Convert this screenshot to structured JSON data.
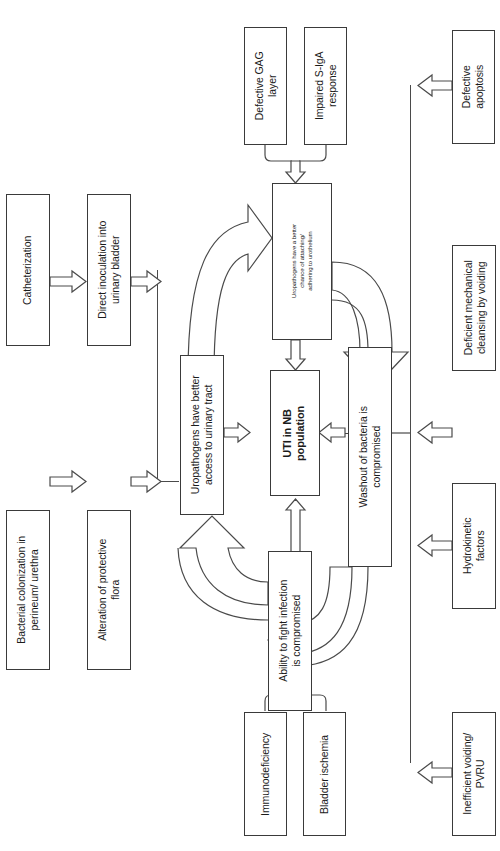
{
  "diagram": {
    "orientation": "rotated-90-ccw",
    "nodes": {
      "catheterization": "Catheterization",
      "direct_inoculation": "Direct inoculation into urinary bladder",
      "bacterial_colonization": "Bacterial colonization in perineum/ urethra",
      "alteration_flora": "Alteration of protective flora",
      "defective_gag": "Defective GAG layer",
      "impaired_siga": "Impaired S-IgA response",
      "uropathogens_adhere": "Uropathogens have a better chance of attaching/ adhering to urothelium",
      "uropathogens_access": "Uropathogens have better access to urinary tract",
      "uti_nb": "UTI in NB population",
      "washout": "Washout of bacteria is compromised",
      "ability_fight": "Ability to fight infection is compromised",
      "immunodeficiency": "Immunodeficiency",
      "bladder_ischemia": "Bladder ischemia",
      "defective_apoptosis": "Defective apoptosis",
      "deficient_cleansing": "Deficient mechanical cleansing by voiding",
      "hydrokinetic": "Hydrokinetic factors",
      "inefficient_voiding": "Inefficient voiding/ PVRU"
    },
    "node_lines": {
      "catheterization": [
        "Catheterization"
      ],
      "direct_inoculation": [
        "Direct inoculation into",
        "urinary bladder"
      ],
      "bacterial_colonization": [
        "Bacterial colonization in",
        "perineum/ urethra"
      ],
      "alteration_flora": [
        "Alteration of protective",
        "flora"
      ],
      "defective_gag": [
        "Defective GAG",
        "layer"
      ],
      "impaired_siga": [
        "Impaired S-IgA",
        "response"
      ],
      "uropathogens_adhere": [
        "Uropathogens have a better",
        "chance of attaching/",
        "adhering to urothelium"
      ],
      "uropathogens_access": [
        "Uropathogens have better",
        "access to urinary tract"
      ],
      "uti_nb": [
        "UTI in NB",
        "population"
      ],
      "washout": [
        "Washout of bacteria is",
        "compromised"
      ],
      "ability_fight": [
        "Ability to fight infection",
        "is compromised"
      ],
      "immunodeficiency": [
        "Immunodeficiency"
      ],
      "bladder_ischemia": [
        "Bladder ischemia"
      ],
      "defective_apoptosis": [
        "Defective",
        "apoptosis"
      ],
      "deficient_cleansing": [
        "Deficient mechanical",
        "cleansing by voiding"
      ],
      "hydrokinetic": [
        "Hydrokinetic",
        "factors"
      ],
      "inefficient_voiding": [
        "Inefficient voiding/",
        "PVRU"
      ]
    },
    "colors": {
      "stroke": "#4a4a4a",
      "box_border": "#3a3a3a",
      "text": "#1b1b1b",
      "background": "#ffffff"
    }
  }
}
